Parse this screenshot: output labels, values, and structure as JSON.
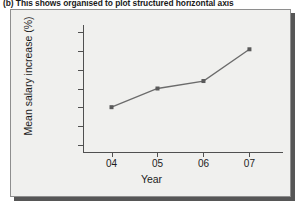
{
  "caption": {
    "text": "(b)  This shows organised to plot structured horizontal axis"
  },
  "figure": {
    "background_color": "#f0f0ee",
    "border_color": "#8e8e8e",
    "shadow_color": "#565656"
  },
  "chart_data": {
    "type": "line",
    "title": "",
    "xlabel": "Year",
    "ylabel": "Mean salary increase (%)",
    "categories": [
      "04",
      "05",
      "06",
      "07"
    ],
    "values": [
      3.0,
      4.0,
      4.4,
      6.1
    ],
    "series": [
      {
        "name": "Mean salary increase",
        "values": [
          3.0,
          4.0,
          4.4,
          6.1
        ]
      }
    ],
    "ylim": [
      0.6,
      7.4
    ],
    "yticks": [
      "1.0",
      "2.0",
      "3.0",
      "4.0",
      "5.0",
      "6.0",
      "7.0"
    ],
    "ytick_values": [
      1.0,
      2.0,
      3.0,
      4.0,
      5.0,
      6.0,
      7.0
    ],
    "xticks": [
      "04",
      "05",
      "06",
      "07"
    ],
    "grid": false,
    "legend": "none",
    "line_color": "#6b6b6b",
    "marker_color": "#5a5a5a",
    "marker_shape": "square",
    "axis_color": "#505050"
  }
}
